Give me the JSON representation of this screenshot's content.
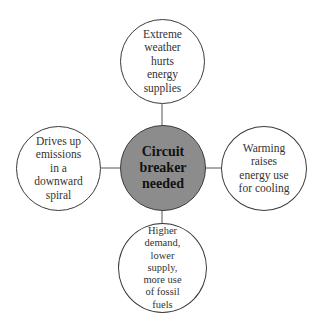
{
  "diagram": {
    "type": "hub-and-spoke",
    "center": {
      "label": "Circuit\nbreaker\nneeded",
      "fill": "#8c8c8c"
    },
    "nodes": {
      "top": {
        "label": "Extreme\nweather\nhurts\nenergy\nsupplies"
      },
      "right": {
        "label": "Warming\nraises\nenergy use\nfor cooling"
      },
      "bottom": {
        "label": "Higher\ndemand,\nlower\nsupply,\nmore use\nof fossil\nfuels"
      },
      "left": {
        "label": "Drives up\nemissions\nin a\ndownward\nspiral"
      }
    },
    "colors": {
      "stroke": "#3a3a3a",
      "outer_fill": "#ffffff",
      "text": "#333333"
    }
  }
}
